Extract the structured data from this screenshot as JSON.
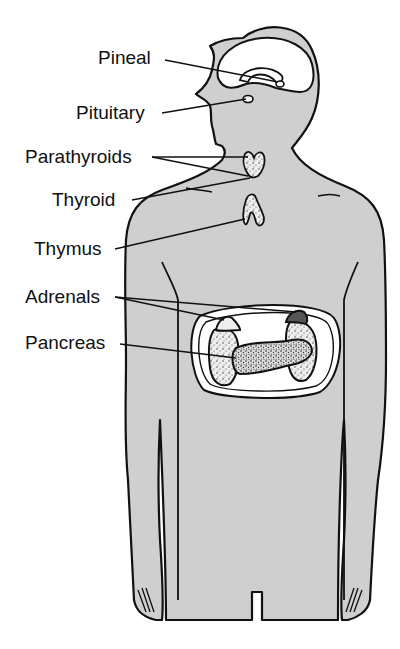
{
  "diagram": {
    "colors": {
      "body_fill": "#cfcfcf",
      "outline": "#111111",
      "gland_fill": "#f4f4f4",
      "cavity_fill": "#ffffff",
      "background": "#ffffff"
    },
    "labels": [
      {
        "id": "pineal",
        "text": "Pineal"
      },
      {
        "id": "pituitary",
        "text": "Pituitary"
      },
      {
        "id": "parathyroids",
        "text": "Parathyroids"
      },
      {
        "id": "thyroid",
        "text": "Thyroid"
      },
      {
        "id": "thymus",
        "text": "Thymus"
      },
      {
        "id": "adrenals",
        "text": "Adrenals"
      },
      {
        "id": "pancreas",
        "text": "Pancreas"
      }
    ]
  }
}
